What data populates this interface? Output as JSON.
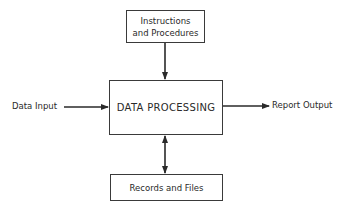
{
  "diagram": {
    "nodes": {
      "instructions": {
        "label_line1": "Instructions",
        "label_line2": "and Procedures"
      },
      "processing": {
        "label": "DATA PROCESSING"
      },
      "records": {
        "label": "Records and Files"
      }
    },
    "inputs": {
      "data_input": "Data Input"
    },
    "outputs": {
      "report_output": "Report Output"
    },
    "edges": [
      {
        "from": "Instructions and Procedures",
        "to": "DATA PROCESSING",
        "direction": "one-way"
      },
      {
        "from": "Data Input",
        "to": "DATA PROCESSING",
        "direction": "one-way"
      },
      {
        "from": "DATA PROCESSING",
        "to": "Report Output",
        "direction": "one-way"
      },
      {
        "from": "DATA PROCESSING",
        "to": "Records and Files",
        "direction": "two-way"
      }
    ],
    "colors": {
      "stroke": "#3a3a3a",
      "text": "#2a2a2a",
      "background": "#ffffff"
    }
  }
}
